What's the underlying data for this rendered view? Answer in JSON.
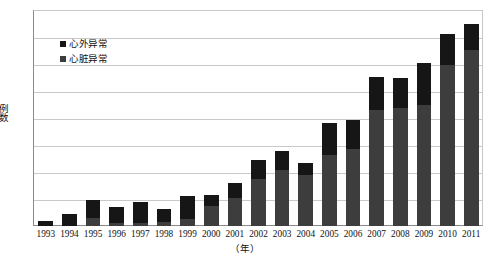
{
  "chart_data": {
    "type": "bar",
    "subtype": "stacked-column",
    "title": "",
    "xlabel": "（年）",
    "ylabel": "例数",
    "ylim": [
      0,
      160
    ],
    "ytick_step": 20,
    "yticks": [
      "0",
      "20",
      "40",
      "60",
      "80",
      "100",
      "120",
      "140",
      "160"
    ],
    "grid": true,
    "legend_position": "inside-top-left",
    "categories": [
      "1993",
      "1994",
      "1995",
      "1996",
      "1997",
      "1998",
      "1999",
      "2000",
      "2001",
      "2002",
      "2003",
      "2004",
      "2005",
      "2006",
      "2007",
      "2008",
      "2009",
      "2010",
      "2011"
    ],
    "series": [
      {
        "name": "心脏异常",
        "color": "#3d3d3d",
        "stack_position": "bottom",
        "values": [
          0,
          0,
          6,
          2,
          2,
          3,
          5,
          15,
          21,
          35,
          42,
          38,
          53,
          57,
          86,
          88,
          90,
          120,
          131
        ]
      },
      {
        "name": "心外异常",
        "color": "#161616",
        "stack_position": "top",
        "values": [
          4,
          9,
          13,
          12,
          16,
          10,
          17,
          8,
          11,
          14,
          14,
          9,
          24,
          22,
          25,
          22,
          31,
          23,
          19
        ]
      }
    ],
    "totals": [
      4,
      9,
      19,
      14,
      18,
      13,
      22,
      23,
      32,
      49,
      56,
      47,
      77,
      79,
      111,
      110,
      121,
      143,
      150
    ]
  },
  "legend": {
    "items": [
      {
        "label": "心外异常",
        "swatch": "#161616"
      },
      {
        "label": "心脏异常",
        "swatch": "#3d3d3d"
      }
    ]
  },
  "axes": {
    "y_title": "例数",
    "x_title": "（年）"
  }
}
